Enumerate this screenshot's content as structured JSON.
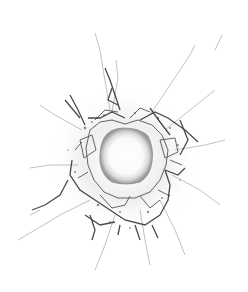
{
  "image": {
    "subject": "bullet hole in cracked glass",
    "background_color": "#ffffff",
    "crack_color": "#2a2a2a",
    "hole": {
      "cx": 125,
      "cy": 155,
      "rx": 26,
      "ry": 27
    }
  }
}
